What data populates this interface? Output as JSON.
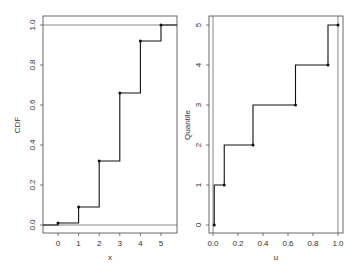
{
  "chart_data": [
    {
      "type": "line",
      "subtype": "step",
      "title": "",
      "xlabel": "x",
      "ylabel": "CDF",
      "xlim": [
        -0.7,
        5.7
      ],
      "ylim": [
        -0.04,
        1.04
      ],
      "xticks": [
        0,
        1,
        2,
        3,
        4,
        5
      ],
      "yticks": [
        0.0,
        0.2,
        0.4,
        0.6,
        0.8,
        1.0
      ],
      "ytick_labels": [
        "0.0",
        "0.2",
        "0.4",
        "0.6",
        "0.8",
        "1.0"
      ],
      "grid": false,
      "reference_lines_y": [
        0.0,
        1.0
      ],
      "series": [
        {
          "name": "CDF",
          "x": [
            0,
            1,
            2,
            3,
            4,
            5
          ],
          "y": [
            0.01,
            0.09,
            0.32,
            0.66,
            0.92,
            1.0
          ]
        }
      ]
    },
    {
      "type": "line",
      "subtype": "step",
      "title": "",
      "xlabel": "u",
      "ylabel": "Quantile",
      "xlim": [
        -0.03,
        1.04
      ],
      "ylim": [
        -0.2,
        5.2
      ],
      "xticks": [
        0.0,
        0.2,
        0.4,
        0.6,
        0.8,
        1.0
      ],
      "xtick_labels": [
        "0.0",
        "0.2",
        "0.4",
        "0.6",
        "0.8",
        "1.0"
      ],
      "yticks": [
        0,
        1,
        2,
        3,
        4,
        5
      ],
      "grid": false,
      "reference_lines_x": [
        0.0,
        1.0
      ],
      "series": [
        {
          "name": "Quantile",
          "u": [
            0.01,
            0.09,
            0.32,
            0.66,
            0.92,
            1.0
          ],
          "y": [
            0,
            1,
            2,
            3,
            4,
            5
          ]
        }
      ]
    }
  ],
  "panels": {
    "left": {
      "xlabel": "x",
      "ylabel": "CDF"
    },
    "right": {
      "xlabel": "u",
      "ylabel": "Quantile"
    }
  },
  "colors": {
    "line": "#111111",
    "frame": "#444444",
    "reference": "#555555",
    "text": "#333333"
  }
}
